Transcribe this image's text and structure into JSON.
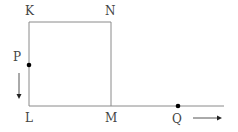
{
  "diagram": {
    "labels": {
      "K": "K",
      "N": "N",
      "P": "P",
      "L": "L",
      "M": "M",
      "Q": "Q"
    },
    "colors": {
      "line": "#8a8a8a",
      "dot": "#000000",
      "text": "#444444"
    },
    "points": {
      "K": [
        29,
        22
      ],
      "N": [
        111,
        22
      ],
      "L": [
        29,
        106
      ],
      "M": [
        111,
        106
      ],
      "P": [
        29,
        65
      ],
      "Q": [
        178,
        106
      ]
    },
    "motion": {
      "P_direction": "down",
      "Q_direction": "right"
    }
  }
}
